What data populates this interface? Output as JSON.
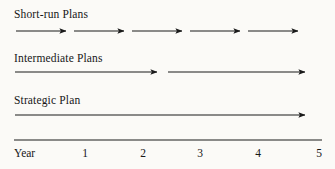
{
  "figure": {
    "background_color": "#fbfaf7",
    "line_color": "#1a1a1a",
    "rows": [
      {
        "id": "short-run",
        "label": "Short-run Plans",
        "label_x": 14,
        "label_y": 8,
        "arrow_y": 31,
        "arrows": [
          {
            "x1": 16,
            "x2": 66
          },
          {
            "x1": 74,
            "x2": 124
          },
          {
            "x1": 132,
            "x2": 182
          },
          {
            "x1": 190,
            "x2": 240
          },
          {
            "x1": 248,
            "x2": 298
          }
        ]
      },
      {
        "id": "intermediate",
        "label": "Intermediate Plans",
        "label_x": 14,
        "label_y": 52,
        "arrow_y": 72,
        "arrows": [
          {
            "x1": 15,
            "x2": 157
          },
          {
            "x1": 168,
            "x2": 305
          }
        ]
      },
      {
        "id": "strategic",
        "label": "Strategic Plan",
        "label_x": 14,
        "label_y": 94,
        "arrow_y": 115,
        "arrows": [
          {
            "x1": 15,
            "x2": 305
          }
        ]
      }
    ],
    "axis": {
      "y": 140,
      "x1": 14,
      "x2": 322,
      "label": "Year",
      "label_x": 14,
      "ticks": [
        {
          "value": "1",
          "x": 85
        },
        {
          "value": "2",
          "x": 143
        },
        {
          "value": "3",
          "x": 200
        },
        {
          "value": "4",
          "x": 258
        },
        {
          "value": "5",
          "x": 319
        }
      ]
    }
  },
  "chart_data": {
    "type": "timeline",
    "title": "",
    "xlabel": "Year",
    "ylabel": "",
    "xlim": [
      0,
      5
    ],
    "grid": false,
    "legend": "none",
    "x_tick_labels": [
      "Year",
      "1",
      "2",
      "3",
      "4",
      "5"
    ],
    "series": [
      {
        "name": "Short-run Plans",
        "segments": [
          {
            "start": 0,
            "end": 1
          },
          {
            "start": 1,
            "end": 2
          },
          {
            "start": 2,
            "end": 3
          },
          {
            "start": 3,
            "end": 4
          },
          {
            "start": 4,
            "end": 5
          }
        ]
      },
      {
        "name": "Intermediate Plans",
        "segments": [
          {
            "start": 0,
            "end": 2.5
          },
          {
            "start": 2.5,
            "end": 5
          }
        ]
      },
      {
        "name": "Strategic Plan",
        "segments": [
          {
            "start": 0,
            "end": 5
          }
        ]
      }
    ]
  }
}
